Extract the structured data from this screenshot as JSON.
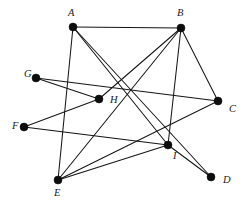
{
  "figure": {
    "kind": "undirected-graph-diagram",
    "width": 243,
    "height": 202,
    "background_color": "#ffffff",
    "edge_color": "#151515",
    "vertex_color": "#0d0d0d",
    "label_color": "#1a1a1a",
    "vertex_radius": 4.0,
    "edge_width": 1.05
  },
  "vertices": [
    {
      "id": "A",
      "label": "A",
      "x": 73,
      "y": 27,
      "label_x": 68,
      "label_y": 14,
      "degree": 4
    },
    {
      "id": "B",
      "label": "B",
      "x": 181,
      "y": 28,
      "label_x": 177,
      "label_y": 14,
      "degree": 4
    },
    {
      "id": "C",
      "label": "C",
      "x": 218,
      "y": 101,
      "label_x": 229,
      "label_y": 110,
      "degree": 3
    },
    {
      "id": "D",
      "label": "D",
      "x": 211,
      "y": 177,
      "label_x": 223,
      "label_y": 181,
      "degree": 2
    },
    {
      "id": "E",
      "label": "E",
      "x": 58,
      "y": 180,
      "label_x": 54,
      "label_y": 194,
      "degree": 3
    },
    {
      "id": "F",
      "label": "F",
      "x": 24,
      "y": 127,
      "label_x": 12,
      "label_y": 127,
      "degree": 2
    },
    {
      "id": "G",
      "label": "G",
      "x": 36,
      "y": 78,
      "label_x": 24,
      "label_y": 75,
      "degree": 2
    },
    {
      "id": "H",
      "label": "H",
      "x": 99,
      "y": 99,
      "label_x": 110,
      "label_y": 101,
      "degree": 3
    },
    {
      "id": "I",
      "label": "I",
      "x": 168,
      "y": 145,
      "label_x": 173,
      "label_y": 157,
      "degree": 6
    }
  ],
  "edges": [
    {
      "from": "A",
      "to": "B"
    },
    {
      "from": "A",
      "to": "E"
    },
    {
      "from": "A",
      "to": "I"
    },
    {
      "from": "A",
      "to": "D"
    },
    {
      "from": "B",
      "to": "C"
    },
    {
      "from": "B",
      "to": "E"
    },
    {
      "from": "B",
      "to": "H"
    },
    {
      "from": "B",
      "to": "I"
    },
    {
      "from": "C",
      "to": "G"
    },
    {
      "from": "C",
      "to": "E"
    },
    {
      "from": "D",
      "to": "I"
    },
    {
      "from": "E",
      "to": "I"
    },
    {
      "from": "F",
      "to": "H"
    },
    {
      "from": "F",
      "to": "I"
    },
    {
      "from": "G",
      "to": "H"
    }
  ]
}
